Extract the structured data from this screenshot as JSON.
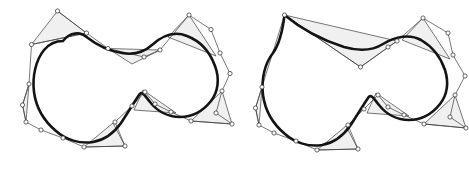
{
  "figure": {
    "background_color": "#ffffff",
    "width": 469,
    "height": 177,
    "style": {
      "curve_color": "#141414",
      "curve_width": 2.6,
      "polygon_stroke_color": "#3c3c3c",
      "polygon_stroke_width": 0.7,
      "polygon_fill_color": "#f0f0f0",
      "control_point_fill": "#ffffff",
      "control_point_stroke": "#2a2a2a",
      "control_point_radius": 2.1
    },
    "panels": [
      {
        "id": "left-panel",
        "name": "smooth-curve-panel",
        "caption": "",
        "control_polygon": [
          [
            57.5,
            11.0
          ],
          [
            86.5,
            33.0
          ],
          [
            31.5,
            44.5
          ],
          [
            108.0,
            48.5
          ],
          [
            144.0,
            57.0
          ],
          [
            160.0,
            50.0
          ],
          [
            189.0,
            15.0
          ],
          [
            211.0,
            29.5
          ],
          [
            220.0,
            53.0
          ],
          [
            230.0,
            73.5
          ],
          [
            222.0,
            91.0
          ],
          [
            216.0,
            113.0
          ],
          [
            232.0,
            124.0
          ],
          [
            191.0,
            121.0
          ],
          [
            171.0,
            112.0
          ],
          [
            155.0,
            104.0
          ],
          [
            145.0,
            92.0
          ],
          [
            132.0,
            106.0
          ],
          [
            115.0,
            122.0
          ],
          [
            125.0,
            146.0
          ],
          [
            84.0,
            147.0
          ],
          [
            63.0,
            138.0
          ],
          [
            41.0,
            130.0
          ],
          [
            26.0,
            122.0
          ],
          [
            22.5,
            105.0
          ],
          [
            29.0,
            84.0
          ]
        ],
        "polygon_triangles": [
          {
            "name": "top-left-triangle",
            "points": [
              [
                57.5,
                11.0
              ],
              [
                86.5,
                33.0
              ],
              [
                31.5,
                44.5
              ]
            ]
          },
          {
            "name": "top-notch-triangle",
            "points": [
              [
                108.0,
                48.5
              ],
              [
                160.0,
                50.0
              ],
              [
                132.0,
                64.0
              ]
            ]
          },
          {
            "name": "top-right-triangle",
            "points": [
              [
                189.0,
                15.0
              ],
              [
                216.0,
                56.0
              ],
              [
                168.0,
                37.0
              ]
            ]
          },
          {
            "name": "mid-notch-triangle",
            "points": [
              [
                143.0,
                90.0
              ],
              [
                176.0,
                113.0
              ],
              [
                134.0,
                110.0
              ]
            ]
          },
          {
            "name": "right-lower-triangle",
            "points": [
              [
                232.0,
                124.0
              ],
              [
                191.0,
                121.0
              ],
              [
                222.0,
                91.0
              ]
            ]
          },
          {
            "name": "bottom-triangle",
            "points": [
              [
                125.0,
                146.0
              ],
              [
                84.0,
                147.0
              ],
              [
                113.0,
                123.0
              ]
            ]
          },
          {
            "name": "left-triangle",
            "points": [
              [
                26.0,
                122.0
              ],
              [
                22.5,
                105.0
              ],
              [
                29.0,
                84.0
              ]
            ]
          }
        ],
        "control_points_count": 26,
        "curve_type": "closed-g1-continuous"
      },
      {
        "id": "right-panel",
        "name": "cusp-curve-panel",
        "caption": "",
        "control_polygon": [
          [
            284.5,
            15.0
          ],
          [
            360.5,
            67.0
          ],
          [
            397.0,
            41.0
          ],
          [
            388.0,
            47.0
          ],
          [
            423.0,
            18.0
          ],
          [
            448.0,
            33.0
          ],
          [
            453.0,
            55.0
          ],
          [
            465.0,
            76.0
          ],
          [
            455.0,
            95.0
          ],
          [
            450.0,
            117.0
          ],
          [
            466.0,
            128.0
          ],
          [
            424.0,
            124.0
          ],
          [
            404.0,
            115.0
          ],
          [
            388.0,
            107.0
          ],
          [
            378.0,
            95.0
          ],
          [
            364.0,
            109.0
          ],
          [
            348.0,
            125.0
          ],
          [
            358.0,
            149.0
          ],
          [
            317.0,
            150.0
          ],
          [
            296.0,
            141.0
          ],
          [
            274.0,
            133.0
          ],
          [
            259.0,
            125.0
          ],
          [
            255.5,
            108.0
          ],
          [
            262.0,
            87.0
          ]
        ],
        "polygon_triangles": [
          {
            "name": "top-notch-triangle",
            "points": [
              [
                284.5,
                15.0
              ],
              [
                397.0,
                41.0
              ],
              [
                360.5,
                67.0
              ]
            ]
          },
          {
            "name": "top-right-triangle",
            "points": [
              [
                423.0,
                18.0
              ],
              [
                450.0,
                59.0
              ],
              [
                402.0,
                40.0
              ]
            ]
          },
          {
            "name": "mid-notch-triangle",
            "points": [
              [
                376.0,
                93.0
              ],
              [
                409.0,
                116.0
              ],
              [
                367.0,
                113.0
              ]
            ]
          },
          {
            "name": "right-lower-triangle",
            "points": [
              [
                466.0,
                128.0
              ],
              [
                424.0,
                124.0
              ],
              [
                455.0,
                95.0
              ]
            ]
          },
          {
            "name": "bottom-triangle",
            "points": [
              [
                358.0,
                149.0
              ],
              [
                317.0,
                150.0
              ],
              [
                346.0,
                126.0
              ]
            ]
          },
          {
            "name": "left-triangle",
            "points": [
              [
                259.0,
                125.0
              ],
              [
                255.5,
                108.0
              ],
              [
                262.0,
                87.0
              ]
            ]
          }
        ],
        "control_points_count": 24,
        "curve_type": "closed-with-cusp-at-top-left"
      }
    ]
  }
}
